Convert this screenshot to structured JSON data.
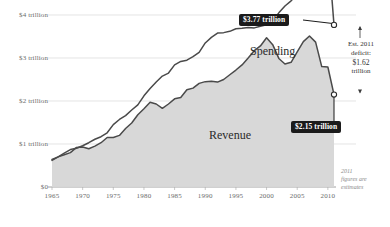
{
  "chart_data": {
    "type": "line",
    "title": "",
    "subtitle": "",
    "xlabel": "",
    "ylabel": "",
    "xlim": [
      1965,
      2011
    ],
    "ylim": [
      0,
      4
    ],
    "grid": true,
    "legend_position": "inline-labels",
    "y_ticks": [
      {
        "value": 4,
        "label": "$4 trillion"
      },
      {
        "value": 3,
        "label": "$3 trillion"
      },
      {
        "value": 2,
        "label": "$2 trillion"
      },
      {
        "value": 1,
        "label": "$1 trillion"
      },
      {
        "value": 0,
        "label": "$0"
      }
    ],
    "x_ticks": [
      {
        "value": 1965,
        "label": "1965"
      },
      {
        "value": 1970,
        "label": "1970"
      },
      {
        "value": 1975,
        "label": "1975"
      },
      {
        "value": 1980,
        "label": "1980"
      },
      {
        "value": 1985,
        "label": "1985"
      },
      {
        "value": 1990,
        "label": "1990"
      },
      {
        "value": 1995,
        "label": "1995"
      },
      {
        "value": 2000,
        "label": "2000"
      },
      {
        "value": 2005,
        "label": "2005"
      },
      {
        "value": 2010,
        "label": "2010"
      }
    ],
    "x": [
      1965,
      1966,
      1967,
      1968,
      1969,
      1970,
      1971,
      1972,
      1973,
      1974,
      1975,
      1976,
      1977,
      1978,
      1979,
      1980,
      1981,
      1982,
      1983,
      1984,
      1985,
      1986,
      1987,
      1988,
      1989,
      1990,
      1991,
      1992,
      1993,
      1994,
      1995,
      1996,
      1997,
      1998,
      1999,
      2000,
      2001,
      2002,
      2003,
      2004,
      2005,
      2006,
      2007,
      2008,
      2009,
      2010,
      2011
    ],
    "series": [
      {
        "name": "Spending",
        "label": "Spending",
        "color": "#4a4a4a",
        "endpoint_label": "$3.77 trillion",
        "values": [
          0.64,
          0.7,
          0.79,
          0.87,
          0.9,
          0.96,
          1.03,
          1.11,
          1.17,
          1.26,
          1.45,
          1.57,
          1.66,
          1.79,
          1.91,
          2.12,
          2.29,
          2.44,
          2.58,
          2.65,
          2.84,
          2.92,
          2.95,
          3.03,
          3.13,
          3.35,
          3.48,
          3.58,
          3.59,
          3.62,
          3.68,
          3.69,
          3.71,
          3.7,
          3.74,
          3.77,
          3.87,
          4.05,
          4.21,
          4.33,
          4.48,
          4.58,
          4.65,
          4.93,
          5.66,
          5.58,
          3.77
        ]
      },
      {
        "name": "Revenue",
        "label": "Revenue",
        "color": "#4a4a4a",
        "endpoint_label": "$2.15 trillion",
        "values": [
          0.62,
          0.7,
          0.75,
          0.8,
          0.92,
          0.93,
          0.89,
          0.95,
          1.03,
          1.15,
          1.15,
          1.2,
          1.36,
          1.49,
          1.68,
          1.82,
          1.97,
          1.93,
          1.83,
          1.93,
          2.05,
          2.08,
          2.26,
          2.3,
          2.41,
          2.45,
          2.46,
          2.44,
          2.5,
          2.61,
          2.72,
          2.84,
          3.0,
          3.17,
          3.28,
          3.47,
          3.31,
          2.99,
          2.86,
          2.9,
          3.14,
          3.38,
          3.51,
          3.37,
          2.8,
          2.79,
          2.15
        ]
      }
    ],
    "annotations": [
      {
        "name": "spending-endpoint-callout",
        "text": "$3.77 trillion",
        "style": "dark-badge"
      },
      {
        "name": "revenue-endpoint-callout",
        "text": "$2.15 trillion",
        "style": "dark-badge"
      },
      {
        "name": "deficit-bracket",
        "line1": "Est. 2011",
        "line2": "deficit:",
        "line3": "$1.62",
        "line4": "trillion"
      },
      {
        "name": "estimate-footnote",
        "line1": "2011",
        "line2": "figures are",
        "line3": "estimates"
      }
    ]
  },
  "colors": {
    "line": "#4a4a4a",
    "fill": "#d6d6d6",
    "grid": "#d9d9d9",
    "axis_text": "#6b6b6b",
    "badge_bg": "#1b1b1b",
    "badge_text": "#ffffff",
    "footnote_text": "#8a8a8a"
  }
}
